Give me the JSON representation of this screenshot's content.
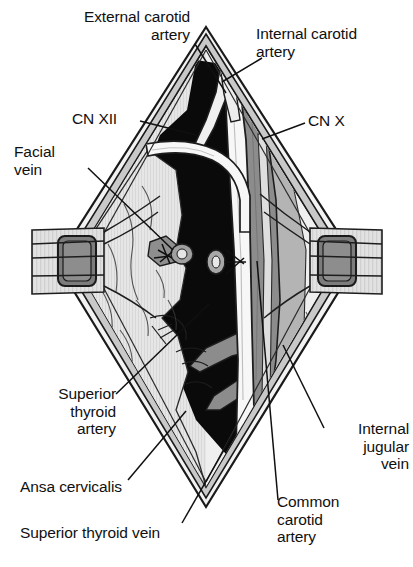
{
  "figure": {
    "type": "medical-anatomical-illustration",
    "palette": {
      "background": "#ffffff",
      "ink": "#101010",
      "skin_light": "#e8e8e8",
      "skin_edge": "#9a9a9a",
      "fascia_light": "#d4d4d4",
      "muscle_mid": "#b5b5b5",
      "vein_gray": "#8a8a8a",
      "retractor_gray": "#7e7e7e",
      "cavity_black": "#0a0a0a",
      "vessel_white": "#f5f5f5"
    }
  },
  "labels": [
    {
      "id": "external-carotid-artery",
      "text": "External carotid\nartery",
      "align": "right",
      "x": 20,
      "y": 8,
      "w": 170,
      "leader": [
        [
          195,
          44
        ],
        [
          226,
          93
        ]
      ]
    },
    {
      "id": "internal-carotid-artery",
      "text": "Internal carotid\nartery",
      "align": "left",
      "x": 256,
      "y": 25,
      "w": 155,
      "leader": [
        [
          262,
          58
        ],
        [
          222,
          82
        ]
      ]
    },
    {
      "id": "cn-xii",
      "text": "CN XII",
      "align": "left",
      "x": 72,
      "y": 110,
      "w": 70,
      "leader": [
        [
          140,
          121
        ],
        [
          196,
          135
        ]
      ]
    },
    {
      "id": "cn-x",
      "text": "CN X",
      "align": "left",
      "x": 308,
      "y": 112,
      "w": 66,
      "leader": [
        [
          305,
          123
        ],
        [
          262,
          139
        ]
      ]
    },
    {
      "id": "facial-vein",
      "text": "Facial\nvein",
      "align": "left",
      "x": 14,
      "y": 143,
      "w": 80,
      "leader": [
        [
          88,
          168
        ],
        [
          173,
          250
        ]
      ]
    },
    {
      "id": "superior-thyroid-artery",
      "text": "Superior\nthyroid\nartery",
      "align": "right",
      "x": 18,
      "y": 385,
      "w": 98,
      "leader": [
        [
          116,
          394
        ],
        [
          209,
          304
        ]
      ]
    },
    {
      "id": "ansa-cervicalis",
      "text": "Ansa cervicalis",
      "align": "left",
      "x": 20,
      "y": 478,
      "w": 150,
      "leader": [
        [
          128,
          480
        ],
        [
          186,
          411
        ]
      ]
    },
    {
      "id": "superior-thyroid-vein",
      "text": "Superior thyroid vein",
      "align": "left",
      "x": 20,
      "y": 524,
      "w": 210,
      "leader": [
        [
          182,
          523
        ],
        [
          232,
          436
        ]
      ]
    },
    {
      "id": "internal-jugular-vein",
      "text": "Internal\njugular\nvein",
      "align": "right",
      "x": 325,
      "y": 420,
      "w": 84,
      "leader": [
        [
          324,
          428
        ],
        [
          283,
          345
        ]
      ]
    },
    {
      "id": "common-carotid-artery",
      "text": "Common\ncarotid\nartery",
      "align": "left",
      "x": 277,
      "y": 493,
      "w": 110,
      "leader": [
        [
          278,
          500
        ],
        [
          257,
          261
        ]
      ]
    }
  ],
  "structures": [
    {
      "id": "skin-margin",
      "name": "Diamond skin incision margin"
    },
    {
      "id": "left-retractor",
      "name": "Left self-retaining retractor blade"
    },
    {
      "id": "right-retractor",
      "name": "Right self-retaining retractor blade"
    },
    {
      "id": "wound-cavity",
      "name": "Deep wound cavity (shadow)"
    },
    {
      "id": "internal-jugular-vein-body",
      "name": "Internal jugular vein"
    },
    {
      "id": "common-carotid-artery-body",
      "name": "Common carotid artery"
    },
    {
      "id": "external-carotid-artery-body",
      "name": "External carotid artery"
    },
    {
      "id": "internal-carotid-artery-body",
      "name": "Internal carotid artery"
    },
    {
      "id": "hypoglossal-nerve",
      "name": "Hypoglossal nerve (CN XII)"
    },
    {
      "id": "vagus-nerve",
      "name": "Vagus nerve (CN X)"
    },
    {
      "id": "facial-vein-stump",
      "name": "Ligated facial vein stump"
    },
    {
      "id": "ansa-cervicalis-loop",
      "name": "Ansa cervicalis loop"
    },
    {
      "id": "superior-thyroid-vessels",
      "name": "Superior thyroid artery and vein"
    }
  ]
}
